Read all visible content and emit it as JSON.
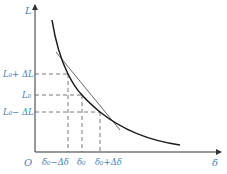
{
  "diagram": {
    "type": "function-curve-with-tangent",
    "colors": {
      "axes": "#333333",
      "curve": "#1a1a1a",
      "tangent": "#555555",
      "dashed": "#555555",
      "labels": "#4a7fb5"
    },
    "axes": {
      "y_label": "L",
      "x_label": "δ",
      "origin_label": "O"
    },
    "y_ticks": [
      {
        "id": "upper",
        "label": "L₀+ ΔL"
      },
      {
        "id": "mid",
        "label": "L₀"
      },
      {
        "id": "lower",
        "label": "L₀− ΔL"
      }
    ],
    "x_ticks": [
      {
        "id": "left",
        "label": "δ₀−Δδ"
      },
      {
        "id": "mid",
        "label": "δ₀"
      },
      {
        "id": "right",
        "label": "δ₀+Δδ"
      }
    ],
    "elements": [
      "decreasing curve L(δ)",
      "tangent line at (δ₀, L₀)",
      "dashed projection lines"
    ]
  }
}
